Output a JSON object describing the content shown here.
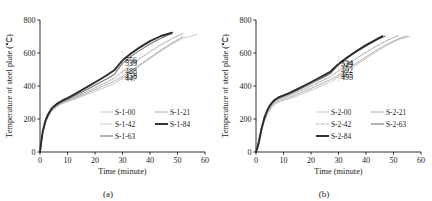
{
  "figure": {
    "panel_a_caption": "(a)",
    "panel_b_caption": "(b)"
  },
  "chart_data": [
    {
      "type": "line",
      "panel": "(a)",
      "title": "",
      "xlabel": "Time (minute)",
      "ylabel": "Temperature of steel plate (℃)",
      "xlim": [
        0,
        60
      ],
      "ylim": [
        0,
        800
      ],
      "xticks": [
        0,
        10,
        20,
        30,
        40,
        50,
        60
      ],
      "yticks": [
        0,
        200,
        400,
        600,
        800
      ],
      "grid": false,
      "legend_position": "lower-right",
      "annotations": [
        {
          "text": "556",
          "x": 30,
          "y": 556
        },
        {
          "text": "539",
          "x": 30,
          "y": 539
        },
        {
          "text": "488",
          "x": 30,
          "y": 488
        },
        {
          "text": "458",
          "x": 30,
          "y": 458
        },
        {
          "text": "447",
          "x": 30,
          "y": 447
        }
      ],
      "series": [
        {
          "name": "S-1-00",
          "style": "solid-thin-light",
          "x": [
            0,
            0.5,
            1,
            2,
            3,
            4,
            5,
            6,
            7,
            8,
            9,
            10,
            12,
            15,
            18,
            21,
            24,
            27,
            30,
            33,
            36,
            40,
            44,
            48,
            52,
            57
          ],
          "values": [
            0,
            60,
            110,
            175,
            213,
            240,
            258,
            272,
            283,
            292,
            299,
            305,
            317,
            335,
            354,
            374,
            394,
            415,
            447,
            482,
            519,
            566,
            612,
            655,
            690,
            712
          ]
        },
        {
          "name": "S-1-21",
          "style": "solid-thin",
          "x": [
            0,
            0.5,
            1,
            2,
            3,
            4,
            5,
            6,
            7,
            8,
            9,
            10,
            12,
            15,
            18,
            21,
            24,
            27,
            30,
            33,
            36,
            40,
            44,
            48,
            52
          ],
          "values": [
            0,
            62,
            115,
            180,
            218,
            245,
            263,
            277,
            288,
            297,
            304,
            310,
            323,
            343,
            364,
            385,
            407,
            430,
            458,
            492,
            527,
            572,
            617,
            660,
            700
          ]
        },
        {
          "name": "S-1-42",
          "style": "dotted",
          "x": [
            0,
            0.5,
            1,
            2,
            3,
            4,
            5,
            6,
            7,
            8,
            9,
            10,
            12,
            15,
            18,
            21,
            24,
            27,
            30,
            33,
            36,
            40,
            44,
            48,
            52
          ],
          "values": [
            0,
            64,
            118,
            184,
            222,
            249,
            267,
            281,
            292,
            301,
            308,
            314,
            328,
            350,
            373,
            397,
            421,
            447,
            488,
            526,
            562,
            608,
            650,
            688,
            718
          ]
        },
        {
          "name": "S-1-63",
          "style": "solid-medium",
          "x": [
            0,
            0.5,
            1,
            2,
            3,
            4,
            5,
            6,
            7,
            8,
            9,
            10,
            12,
            15,
            18,
            21,
            24,
            27,
            30,
            33,
            36,
            40,
            44,
            48
          ],
          "values": [
            0,
            66,
            122,
            188,
            226,
            253,
            271,
            285,
            296,
            305,
            313,
            320,
            336,
            361,
            387,
            414,
            441,
            470,
            539,
            578,
            613,
            655,
            690,
            718
          ]
        },
        {
          "name": "S-1-84",
          "style": "solid-thick",
          "x": [
            0,
            0.5,
            1,
            2,
            3,
            4,
            5,
            6,
            7,
            8,
            9,
            10,
            12,
            15,
            18,
            21,
            24,
            27,
            30,
            33,
            36,
            40,
            44,
            48
          ],
          "values": [
            0,
            68,
            126,
            192,
            231,
            258,
            276,
            290,
            301,
            311,
            319,
            327,
            345,
            373,
            402,
            432,
            462,
            495,
            556,
            596,
            631,
            672,
            703,
            723
          ]
        }
      ]
    },
    {
      "type": "line",
      "panel": "(b)",
      "title": "",
      "xlabel": "Time (minute)",
      "ylabel": "Temperature of steel plate (℃)",
      "xlim": [
        0,
        60
      ],
      "ylim": [
        0,
        800
      ],
      "xticks": [
        0,
        10,
        20,
        30,
        40,
        50,
        60
      ],
      "yticks": [
        0,
        200,
        400,
        600,
        800
      ],
      "grid": false,
      "legend_position": "lower-right",
      "annotations": [
        {
          "text": "534",
          "x": 30,
          "y": 534
        },
        {
          "text": "529",
          "x": 30,
          "y": 529
        },
        {
          "text": "492",
          "x": 30,
          "y": 492
        },
        {
          "text": "465",
          "x": 30,
          "y": 465
        },
        {
          "text": "455",
          "x": 30,
          "y": 455
        }
      ],
      "series": [
        {
          "name": "S-2-00",
          "style": "solid-thin-light",
          "x": [
            0,
            0.5,
            1,
            1.5,
            2,
            3,
            4,
            5,
            6,
            7,
            8,
            9,
            10,
            12,
            15,
            18,
            21,
            24,
            27,
            30,
            33,
            36,
            40,
            44,
            48,
            52,
            56
          ],
          "values": [
            0,
            30,
            62,
            96,
            128,
            182,
            222,
            252,
            274,
            290,
            300,
            307,
            312,
            322,
            340,
            360,
            381,
            402,
            424,
            455,
            489,
            523,
            567,
            610,
            650,
            682,
            700
          ]
        },
        {
          "name": "S-2-21",
          "style": "solid-thin",
          "x": [
            0,
            0.5,
            1,
            1.5,
            2,
            3,
            4,
            5,
            6,
            7,
            8,
            9,
            10,
            12,
            15,
            18,
            21,
            24,
            27,
            30,
            33,
            36,
            40,
            44,
            48,
            52,
            55
          ],
          "values": [
            0,
            32,
            66,
            102,
            135,
            190,
            231,
            261,
            282,
            297,
            307,
            314,
            319,
            330,
            350,
            371,
            393,
            415,
            438,
            465,
            499,
            533,
            577,
            619,
            657,
            688,
            703
          ]
        },
        {
          "name": "S-2-42",
          "style": "dashdot",
          "x": [
            0,
            0.5,
            1,
            1.5,
            2,
            3,
            4,
            5,
            6,
            7,
            8,
            9,
            10,
            12,
            15,
            18,
            21,
            24,
            27,
            30,
            33,
            36,
            40,
            44,
            48,
            52
          ],
          "values": [
            0,
            34,
            70,
            108,
            142,
            198,
            240,
            270,
            291,
            306,
            316,
            323,
            329,
            341,
            362,
            384,
            407,
            431,
            456,
            492,
            527,
            561,
            604,
            644,
            679,
            706
          ]
        },
        {
          "name": "S-2-63",
          "style": "solid-medium",
          "x": [
            0,
            0.5,
            1,
            1.5,
            2,
            3,
            4,
            5,
            6,
            7,
            8,
            9,
            10,
            12,
            15,
            18,
            21,
            24,
            27,
            30,
            33,
            36,
            40,
            44,
            47
          ],
          "values": [
            0,
            36,
            74,
            113,
            148,
            205,
            247,
            277,
            298,
            313,
            324,
            331,
            337,
            350,
            373,
            397,
            422,
            447,
            474,
            529,
            566,
            601,
            643,
            680,
            702
          ]
        },
        {
          "name": "S-2-84",
          "style": "solid-thick",
          "x": [
            0,
            0.5,
            1,
            1.5,
            2,
            3,
            4,
            5,
            6,
            7,
            8,
            9,
            10,
            12,
            15,
            18,
            21,
            24,
            27,
            30,
            33,
            36,
            40,
            44,
            46
          ],
          "values": [
            0,
            25,
            55,
            95,
            140,
            205,
            250,
            281,
            303,
            318,
            329,
            337,
            343,
            357,
            381,
            406,
            432,
            458,
            486,
            534,
            571,
            606,
            648,
            684,
            702
          ]
        }
      ]
    }
  ],
  "panel_a": {
    "ylabel": "Temperature of steel plate (℃)",
    "xlabel": "Time (minute)",
    "yticks": [
      "800",
      "600",
      "400",
      "200",
      "0"
    ],
    "xticks": [
      "0",
      "10",
      "20",
      "30",
      "40",
      "50",
      "60"
    ],
    "annotations": [
      "556",
      "539",
      "488",
      "458",
      "447"
    ],
    "legend": [
      "S-1-00",
      "S-1-21",
      "S-1-42",
      "S-1-84",
      "S-1-63"
    ],
    "caption": "(a)"
  },
  "panel_b": {
    "ylabel": "Temperature of steel plate (℃)",
    "xlabel": "Time (minute)",
    "yticks": [
      "800",
      "600",
      "400",
      "200",
      "0"
    ],
    "xticks": [
      "0",
      "10",
      "20",
      "30",
      "40",
      "50",
      "60"
    ],
    "annotations": [
      "534",
      "529",
      "492",
      "465",
      "455"
    ],
    "legend": [
      "S-2-00",
      "S-2-21",
      "S-2-42",
      "S-2-63",
      "S-2-84"
    ],
    "caption": "(b)"
  }
}
